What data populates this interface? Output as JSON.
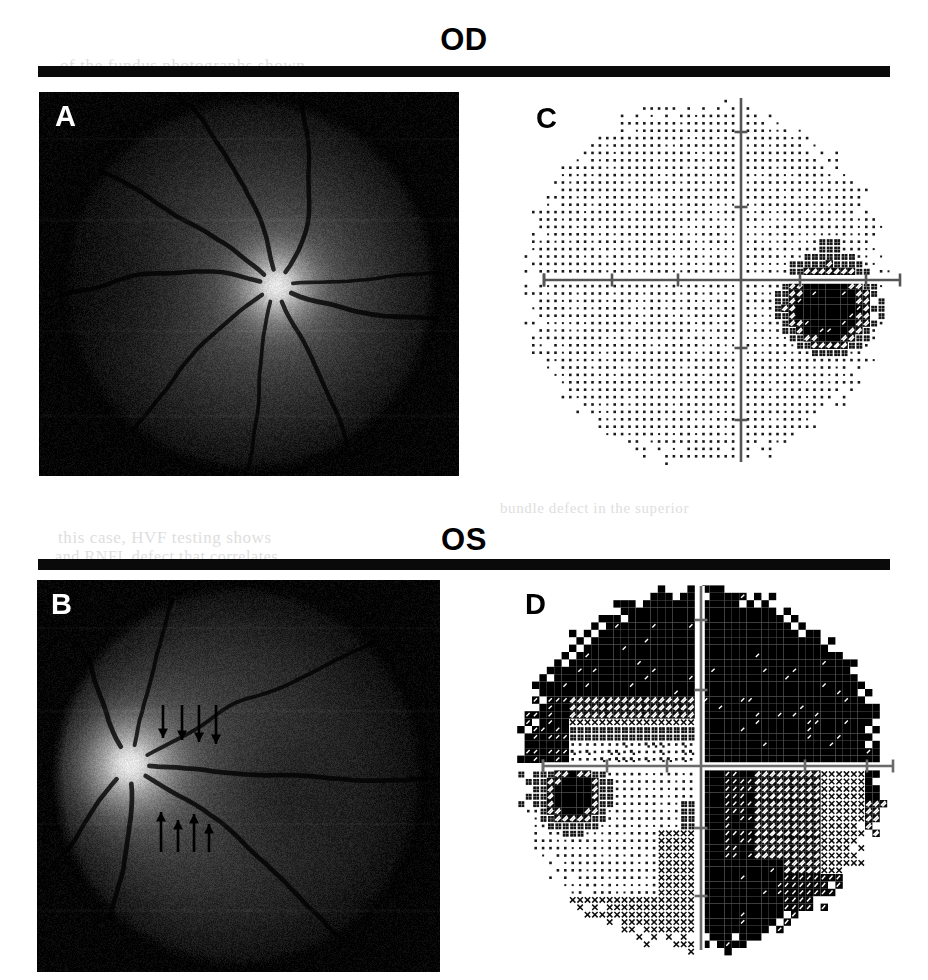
{
  "figure": {
    "kind": "ophthalmic-figure",
    "background": "#ffffff",
    "rule_color": "#0a0a0a"
  },
  "sections": [
    {
      "id": "od",
      "title": "OD",
      "title_x": 460,
      "title_y": 22,
      "rule": {
        "x": 38,
        "y": 66,
        "width": 852,
        "height": 11
      }
    },
    {
      "id": "os",
      "title": "OS",
      "title_x": 460,
      "title_y": 522,
      "rule": {
        "x": 38,
        "y": 559,
        "width": 852,
        "height": 11
      }
    }
  ],
  "panels": [
    {
      "id": "A",
      "label": "A",
      "type": "fundus-photograph",
      "eye": "OD",
      "label_color": "#ffffff",
      "frame": {
        "x": 39,
        "y": 92,
        "width": 420,
        "height": 384
      },
      "label_pos": {
        "x": 16,
        "y": 10
      },
      "optic_disc": {
        "cx": 0.565,
        "cy": 0.505,
        "r": 0.062,
        "brightness": 1.0
      },
      "macula": {
        "cx": 0.25,
        "cy": 0.5,
        "r": 0.13
      },
      "globe": {
        "cx": 0.5,
        "cy": 0.5,
        "rx": 0.455,
        "ry": 0.5
      },
      "base_gray": "#2b2b2b",
      "vessels": 9,
      "annotation_arrows": []
    },
    {
      "id": "B",
      "label": "B",
      "type": "fundus-photograph",
      "eye": "OS",
      "label_color": "#ffffff",
      "frame": {
        "x": 37,
        "y": 580,
        "width": 403,
        "height": 392
      },
      "label_pos": {
        "x": 14,
        "y": 10
      },
      "optic_disc": {
        "cx": 0.23,
        "cy": 0.47,
        "r": 0.072,
        "brightness": 1.0
      },
      "macula": {
        "cx": 0.61,
        "cy": 0.545,
        "r": 0.115
      },
      "globe": {
        "cx": 0.5,
        "cy": 0.5,
        "rx": 0.47,
        "ry": 0.5
      },
      "base_gray": "#242424",
      "vessels": 7,
      "annotation_arrows": [
        {
          "group": "superior-rnfl-defect-border",
          "direction": "down",
          "items": [
            {
              "x": 163,
              "y0": 705,
              "y1": 738
            },
            {
              "x": 182,
              "y0": 705,
              "y1": 740
            },
            {
              "x": 199,
              "y0": 705,
              "y1": 742
            },
            {
              "x": 216,
              "y0": 705,
              "y1": 744
            }
          ]
        },
        {
          "group": "inferior-rnfl-defect-border",
          "direction": "up",
          "items": [
            {
              "x": 161,
              "y0": 852,
              "y1": 812
            },
            {
              "x": 178,
              "y0": 852,
              "y1": 820
            },
            {
              "x": 194,
              "y0": 852,
              "y1": 814
            },
            {
              "x": 209,
              "y0": 852,
              "y1": 824
            }
          ]
        }
      ]
    },
    {
      "id": "C",
      "label": "C",
      "type": "visual-field-grayscale",
      "eye": "OD",
      "label_color": "#000000",
      "frame": {
        "x": 500,
        "y": 90,
        "width": 410,
        "height": 400
      },
      "label_pos": {
        "x": 36,
        "y": 14
      },
      "axes": {
        "origin_x": 241,
        "origin_y": 190,
        "h_from": 44,
        "h_to": 400,
        "v_from": 8,
        "v_to": 372,
        "tick_len": 13,
        "h_ticks": [
          44,
          112,
          178,
          300,
          366
        ],
        "v_ticks": [
          42,
          117,
          258,
          330
        ],
        "color": "#555555",
        "line_width": 2.6
      },
      "field_outline": {
        "cx": 0.5,
        "cy": 0.48,
        "rx": 0.455,
        "ry": 0.465
      },
      "severity_note": "near-normal field with enlarged blind spot",
      "defects": [
        {
          "name": "enlarged-blind-spot",
          "cx": 0.8,
          "cy": 0.555,
          "rx": 0.072,
          "ry": 0.085,
          "level": 5
        }
      ]
    },
    {
      "id": "D",
      "label": "D",
      "type": "visual-field-grayscale",
      "eye": "OS",
      "label_color": "#000000",
      "frame": {
        "x": 495,
        "y": 578,
        "width": 412,
        "height": 396
      },
      "label_pos": {
        "x": 30,
        "y": 12
      },
      "axes": {
        "origin_x": 206,
        "origin_y": 188,
        "h_from": 48,
        "h_to": 398,
        "v_from": 8,
        "v_to": 372,
        "tick_len": 13,
        "h_ticks": [
          48,
          112,
          172,
          310,
          372
        ],
        "v_ticks": [
          42,
          112,
          250,
          318
        ],
        "color": "#6a6a6a",
        "line_width": 2.6
      },
      "field_outline": {
        "cx": 0.5,
        "cy": 0.48,
        "rx": 0.455,
        "ry": 0.47
      },
      "severity_note": "dense superior and temporal absolute defect, respecting vertical and horizontal meridians",
      "defects": [
        {
          "name": "superior-absolute-defect",
          "region": "superior",
          "level": 9
        },
        {
          "name": "right-hemifield-absolute-defect",
          "region": "right",
          "level": 9
        },
        {
          "name": "inferior-nasal-residual-island",
          "region": "lower-left",
          "level": 0
        },
        {
          "name": "blind-spot",
          "cx": 0.19,
          "cy": 0.545,
          "rx": 0.055,
          "ry": 0.06,
          "level": 9
        }
      ]
    }
  ],
  "ghost_text": [
    {
      "text": "of the fundus photographs shown",
      "x": 60,
      "y": 56,
      "size": 17
    },
    {
      "text": "this case, HVF testing shows",
      "x": 58,
      "y": 528,
      "size": 17
    },
    {
      "text": "and RNFL defect that correlates",
      "x": 55,
      "y": 548,
      "size": 16
    },
    {
      "text": "bundle defect in the superior",
      "x": 500,
      "y": 500,
      "size": 15
    }
  ],
  "grayscale_legend": {
    "levels": [
      "white",
      "light-stipple",
      "dense-stipple",
      "cross-hatch",
      "dark-hatch",
      "black"
    ],
    "meaning": "Humphrey visual field grayscale: darker = greater sensitivity loss"
  }
}
